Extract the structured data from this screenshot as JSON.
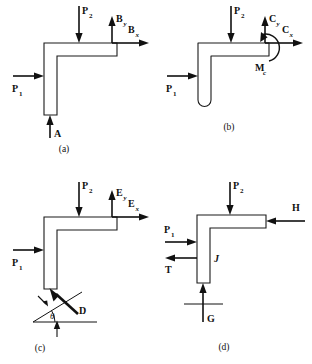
{
  "figure": {
    "panel_count": 4,
    "background_color": "#ffffff",
    "line_color": "#111111"
  },
  "panels": [
    {
      "id": "a",
      "caption": "(a)",
      "support_type": "pin-and-roller",
      "labels": {
        "p1": "P",
        "p1_sub": "1",
        "p2": "P",
        "p2_sub": "2",
        "by": "B",
        "by_sub": "y",
        "bx": "B",
        "bx_sub": "x",
        "a_point": "A"
      }
    },
    {
      "id": "b",
      "caption": "(b)",
      "support_type": "fixed-cantilever",
      "labels": {
        "p1": "P",
        "p1_sub": "1",
        "p2": "P",
        "p2_sub": "2",
        "cy": "C",
        "cy_sub": "y",
        "cx": "C",
        "cx_sub": "x",
        "mc": "M",
        "mc_sub": "c"
      }
    },
    {
      "id": "c",
      "caption": "(c)",
      "support_type": "inclined-link",
      "labels": {
        "p1": "P",
        "p1_sub": "1",
        "p2": "P",
        "p2_sub": "2",
        "ey": "E",
        "ey_sub": "y",
        "ex": "E",
        "ex_sub": "x",
        "d_point": "D",
        "theta": "θ"
      }
    },
    {
      "id": "d",
      "caption": "(d)",
      "support_type": "two-force-members",
      "labels": {
        "p1": "P",
        "p1_sub": "1",
        "p2": "P",
        "p2_sub": "2",
        "h": "H",
        "t": "T",
        "j_point": "J",
        "g_point": "G"
      }
    }
  ]
}
